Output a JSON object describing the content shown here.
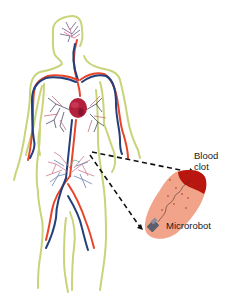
{
  "figure": {
    "labels": {
      "blood_clot_line1": "Blood",
      "blood_clot_line2": "clot",
      "microrobot": "Microrobot"
    },
    "colors": {
      "body_outline": "#c9d47a",
      "artery": "#e8442a",
      "vein": "#24407a",
      "heart": "#b3203a",
      "vessel_inset": "#f2a48a",
      "clot": "#b8160e",
      "robot": "#5a5f6e",
      "pointer": "#111111"
    },
    "elements": [
      "human-body-outline",
      "circulatory-system",
      "heart",
      "lungs-vasculature",
      "brain-vasculature",
      "abdominal-vasculature",
      "zoom-pointer-lines",
      "blood-vessel-inset",
      "blood-clot",
      "microrobot"
    ]
  }
}
